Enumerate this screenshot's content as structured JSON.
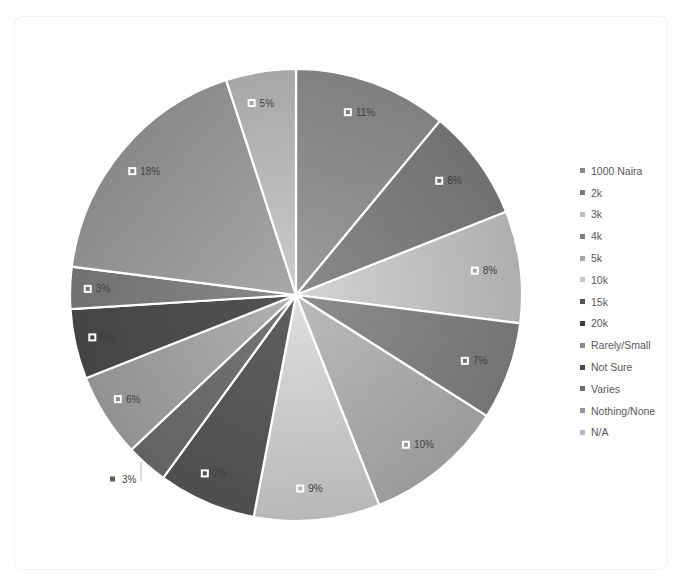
{
  "chart_data": {
    "type": "pie",
    "title": "",
    "start_angle_deg": 0,
    "direction": "clockwise",
    "legend_position": "right",
    "categories": [
      "1000 Naira",
      "2k",
      "3k",
      "4k",
      "5k",
      "10k",
      "15k",
      "20k",
      "Rarely/Small",
      "Not Sure",
      "Varies",
      "Nothing/None",
      "N/A"
    ],
    "values": [
      11,
      8,
      8,
      7,
      10,
      9,
      7,
      3,
      6,
      5,
      3,
      18,
      5
    ],
    "labels": [
      "11%",
      "8%",
      "8%",
      "7%",
      "10%",
      "9%",
      "7%",
      "3%",
      "6%",
      "5%",
      "3%",
      "18%",
      "5%"
    ],
    "colors": [
      "#8a8a8a",
      "#7a7a7a",
      "#bdbdbd",
      "#7e7e7e",
      "#a7a7a7",
      "#c7c7c7",
      "#555555",
      "#6a6a6a",
      "#9e9e9e",
      "#4a4a4a",
      "#7a7a7a",
      "#959595",
      "#b5b5b5"
    ]
  },
  "legend": {
    "items": [
      {
        "label": "1000 Naira",
        "color": "#8a8a8a"
      },
      {
        "label": "2k",
        "color": "#7a7a7a"
      },
      {
        "label": "3k",
        "color": "#bdbdbd"
      },
      {
        "label": "4k",
        "color": "#7e7e7e"
      },
      {
        "label": "5k",
        "color": "#a7a7a7"
      },
      {
        "label": "10k",
        "color": "#c7c7c7"
      },
      {
        "label": "15k",
        "color": "#555555"
      },
      {
        "label": "20k",
        "color": "#3f3f3f"
      },
      {
        "label": "Rarely/Small",
        "color": "#8c8c8c"
      },
      {
        "label": "Not Sure",
        "color": "#4a4a4a"
      },
      {
        "label": "Varies",
        "color": "#6e6e6e"
      },
      {
        "label": "Nothing/None",
        "color": "#959595"
      },
      {
        "label": "N/A",
        "color": "#b5b5b5"
      }
    ]
  }
}
